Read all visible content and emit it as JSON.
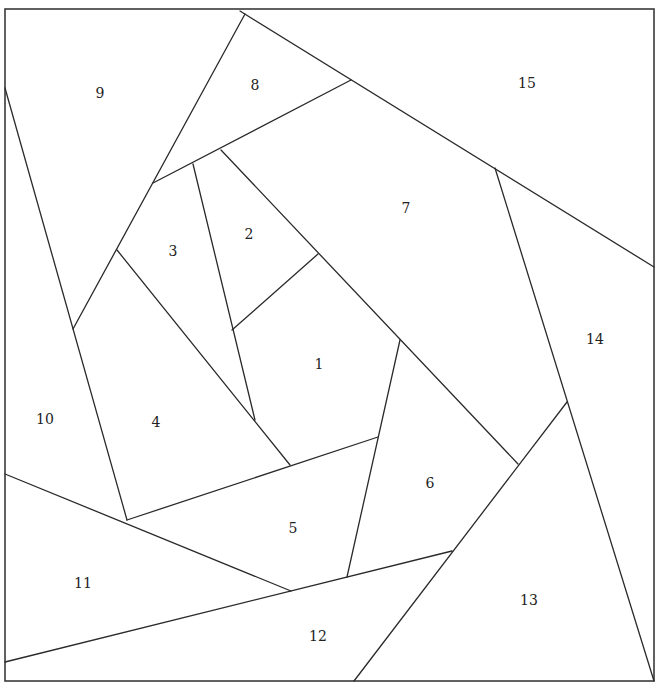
{
  "diagram": {
    "type": "tiling-puzzle",
    "frame": {
      "x1": 5,
      "y1": 9,
      "x2": 654,
      "y2": 681
    },
    "stroke_color": "#2a2a2a",
    "background": "#ffffff",
    "segments": [
      [
        240,
        11,
        654,
        267
      ],
      [
        245,
        14,
        73,
        329
      ],
      [
        351,
        80,
        153,
        183
      ],
      [
        193,
        164,
        255,
        420
      ],
      [
        221,
        150,
        518,
        464
      ],
      [
        318,
        254,
        232,
        330
      ],
      [
        117,
        250,
        290,
        465
      ],
      [
        5,
        88,
        127,
        520
      ],
      [
        127,
        520,
        378,
        437
      ],
      [
        400,
        340,
        347,
        577
      ],
      [
        495,
        168,
        654,
        681
      ],
      [
        567,
        402,
        354,
        681
      ],
      [
        5,
        474,
        291,
        591
      ],
      [
        5,
        662,
        452,
        551
      ]
    ],
    "regions": [
      {
        "id": "1",
        "label": "1",
        "x": 319,
        "y": 365
      },
      {
        "id": "2",
        "label": "2",
        "x": 249,
        "y": 235
      },
      {
        "id": "3",
        "label": "3",
        "x": 173,
        "y": 252
      },
      {
        "id": "4",
        "label": "4",
        "x": 156,
        "y": 423
      },
      {
        "id": "5",
        "label": "5",
        "x": 293,
        "y": 529
      },
      {
        "id": "6",
        "label": "6",
        "x": 430,
        "y": 484
      },
      {
        "id": "7",
        "label": "7",
        "x": 406,
        "y": 209
      },
      {
        "id": "8",
        "label": "8",
        "x": 255,
        "y": 86
      },
      {
        "id": "9",
        "label": "9",
        "x": 100,
        "y": 94
      },
      {
        "id": "10",
        "label": "10",
        "x": 45,
        "y": 420
      },
      {
        "id": "11",
        "label": "11",
        "x": 83,
        "y": 584
      },
      {
        "id": "12",
        "label": "12",
        "x": 318,
        "y": 637
      },
      {
        "id": "13",
        "label": "13",
        "x": 529,
        "y": 601
      },
      {
        "id": "14",
        "label": "14",
        "x": 595,
        "y": 340
      },
      {
        "id": "15",
        "label": "15",
        "x": 527,
        "y": 84
      }
    ]
  }
}
